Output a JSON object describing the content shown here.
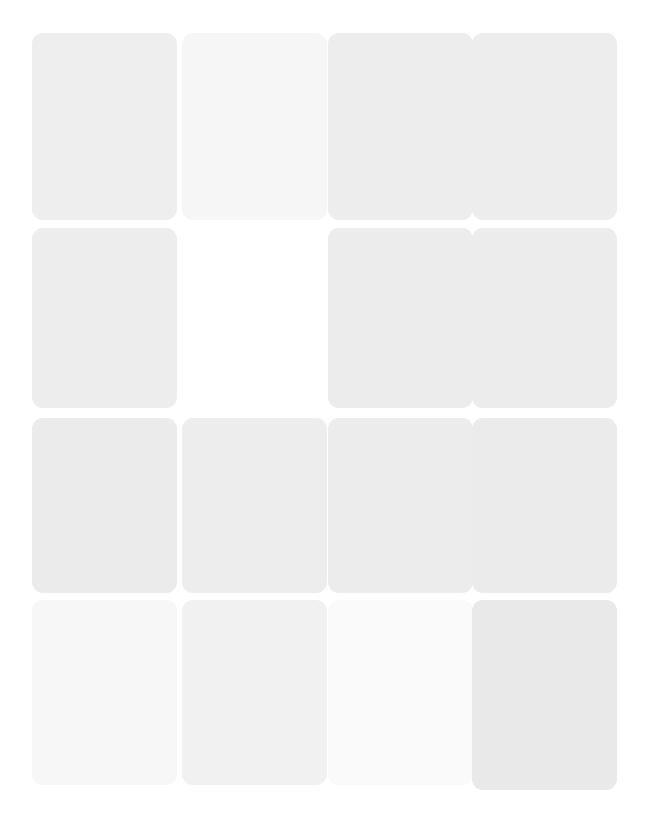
{
  "page": {
    "background": "#ffffff",
    "width": 647,
    "height": 838,
    "layout": "card-grid",
    "columns": 4,
    "rows": 4
  },
  "grid": {
    "cards": [
      {
        "slot": "r1c1",
        "x": 32,
        "y": 33,
        "w": 145,
        "h": 187,
        "fill": "#eeeeee",
        "text_color": "#e6e6e6",
        "title": "",
        "body": "",
        "meta": "",
        "empty": false
      },
      {
        "slot": "r1c2",
        "x": 182,
        "y": 33,
        "w": 145,
        "h": 187,
        "fill": "#f6f6f6",
        "text_color": "#efefef",
        "title": "",
        "body": "",
        "meta": "",
        "empty": false
      },
      {
        "slot": "r1c3",
        "x": 328,
        "y": 33,
        "w": 145,
        "h": 187,
        "fill": "#ededed",
        "text_color": "#e5e5e5",
        "title": "",
        "body": "",
        "meta": "",
        "empty": false
      },
      {
        "slot": "r1c4",
        "x": 472,
        "y": 33,
        "w": 145,
        "h": 187,
        "fill": "#ededed",
        "text_color": "#e5e5e5",
        "title": "",
        "body": "",
        "meta": "",
        "empty": false
      },
      {
        "slot": "r2c1",
        "x": 32,
        "y": 228,
        "w": 145,
        "h": 180,
        "fill": "#ededed",
        "text_color": "#e4e4e4",
        "title": "",
        "body": "",
        "meta": "",
        "empty": false
      },
      {
        "slot": "r2c2",
        "x": 182,
        "y": 228,
        "w": 145,
        "h": 180,
        "fill": "#ffffff",
        "text_color": "#ffffff",
        "title": "",
        "body": "",
        "meta": "",
        "empty": true
      },
      {
        "slot": "r2c3",
        "x": 328,
        "y": 228,
        "w": 145,
        "h": 180,
        "fill": "#ececec",
        "text_color": "#e3e3e3",
        "title": "",
        "body": "",
        "meta": "",
        "empty": false
      },
      {
        "slot": "r2c4",
        "x": 472,
        "y": 228,
        "w": 145,
        "h": 180,
        "fill": "#ececec",
        "text_color": "#e3e3e3",
        "title": "",
        "body": "",
        "meta": "",
        "empty": false
      },
      {
        "slot": "r3c1",
        "x": 32,
        "y": 418,
        "w": 145,
        "h": 175,
        "fill": "#ebebeb",
        "text_color": "#e3e3e3",
        "title": "",
        "body": "",
        "meta": "",
        "empty": false
      },
      {
        "slot": "r3c2",
        "x": 182,
        "y": 418,
        "w": 145,
        "h": 175,
        "fill": "#ededed",
        "text_color": "#e4e4e4",
        "title": "",
        "body": "",
        "meta": "",
        "empty": false
      },
      {
        "slot": "r3c3",
        "x": 328,
        "y": 418,
        "w": 145,
        "h": 175,
        "fill": "#ececec",
        "text_color": "#e3e3e3",
        "title": "",
        "body": "",
        "meta": "",
        "empty": false
      },
      {
        "slot": "r3c4",
        "x": 472,
        "y": 418,
        "w": 145,
        "h": 175,
        "fill": "#ebebeb",
        "text_color": "#e2e2e2",
        "title": "",
        "body": "",
        "meta": "",
        "empty": false
      },
      {
        "slot": "r4c1",
        "x": 32,
        "y": 600,
        "w": 145,
        "h": 185,
        "fill": "#f7f7f7",
        "text_color": "#f0f0f0",
        "title": "",
        "body": "",
        "meta": "",
        "empty": false
      },
      {
        "slot": "r4c2",
        "x": 182,
        "y": 600,
        "w": 145,
        "h": 185,
        "fill": "#f1f1f1",
        "text_color": "#e9e9e9",
        "title": "",
        "body": "",
        "meta": "",
        "empty": false
      },
      {
        "slot": "r4c3",
        "x": 328,
        "y": 600,
        "w": 145,
        "h": 185,
        "fill": "#fafafa",
        "text_color": "#f4f4f4",
        "title": "",
        "body": "",
        "meta": "",
        "empty": false
      },
      {
        "slot": "r4c4",
        "x": 472,
        "y": 600,
        "w": 145,
        "h": 190,
        "fill": "#e9e9e9",
        "text_color": "#e1e1e1",
        "title": "",
        "body": "",
        "meta": "",
        "empty": false
      }
    ]
  }
}
